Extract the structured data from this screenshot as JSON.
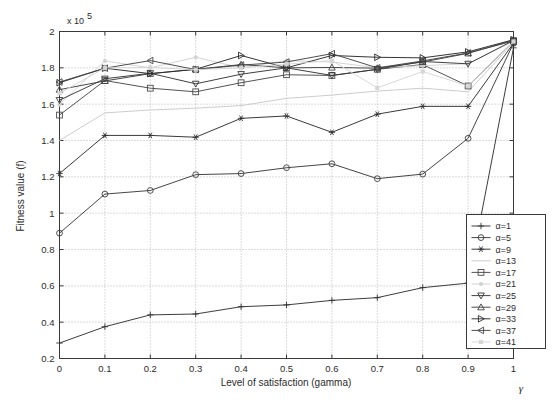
{
  "chart_data": {
    "type": "line",
    "title": "",
    "xlabel": "Level of satisfaction (gamma)",
    "ylabel": "Fitness value (f)",
    "y_multiplier_label": "x 10",
    "y_multiplier_exponent": "5",
    "x_axis_symbol": "γ",
    "xlim": [
      0,
      1
    ],
    "ylim": [
      0.2,
      2
    ],
    "grid": true,
    "legend_position": "lower right",
    "x": [
      0,
      0.1,
      0.2,
      0.3,
      0.4,
      0.5,
      0.6,
      0.7,
      0.8,
      0.9,
      1
    ],
    "xticklabels": [
      "0",
      "0.1",
      "0.2",
      "0.3",
      "0.4",
      "0.5",
      "0.6",
      "0.7",
      "0.8",
      "0.9",
      "1"
    ],
    "yticklabels": [
      "0.2",
      "0.4",
      "0.6",
      "0.8",
      "1",
      "1.2",
      "1.4",
      "1.6",
      "1.8",
      "2"
    ],
    "yticks": [
      0.2,
      0.4,
      0.6,
      0.8,
      1.0,
      1.2,
      1.4,
      1.6,
      1.8,
      2.0
    ],
    "series": [
      {
        "name": "α=1",
        "marker": "plus",
        "color": "#333333",
        "values": [
          0.285,
          0.375,
          0.44,
          0.445,
          0.485,
          0.495,
          0.52,
          0.535,
          0.59,
          0.615,
          1.91
        ]
      },
      {
        "name": "α=5",
        "marker": "circle",
        "color": "#3b3b3b",
        "values": [
          0.89,
          1.105,
          1.125,
          1.212,
          1.218,
          1.25,
          1.272,
          1.19,
          1.215,
          1.412,
          1.935
        ]
      },
      {
        "name": "α=9",
        "marker": "asterisk",
        "color": "#2e2e2e",
        "values": [
          1.218,
          1.428,
          1.428,
          1.418,
          1.522,
          1.535,
          1.445,
          1.545,
          1.588,
          1.588,
          1.935
        ]
      },
      {
        "name": "α=13",
        "marker": "none",
        "color": "#c9c9c9",
        "values": [
          1.4,
          1.552,
          1.568,
          1.578,
          1.592,
          1.632,
          1.65,
          1.672,
          1.688,
          1.668,
          1.94
        ]
      },
      {
        "name": "α=17",
        "marker": "square",
        "color": "#4a4a4a",
        "values": [
          1.54,
          1.73,
          1.688,
          1.668,
          1.718,
          1.762,
          1.758,
          1.792,
          1.818,
          1.7,
          1.945
        ]
      },
      {
        "name": "α=21",
        "marker": "dot",
        "color": "#d2d2d2",
        "values": [
          1.598,
          1.838,
          1.8,
          1.858,
          1.8,
          1.84,
          1.832,
          1.8,
          1.812,
          1.822,
          1.95
        ]
      },
      {
        "name": "α=25",
        "marker": "triangle-down",
        "color": "#363636",
        "values": [
          1.622,
          1.74,
          1.77,
          1.712,
          1.765,
          1.8,
          1.758,
          1.792,
          1.835,
          1.822,
          1.95
        ]
      },
      {
        "name": "α=29",
        "marker": "triangle-up",
        "color": "#3f3f3f",
        "values": [
          1.68,
          1.728,
          1.768,
          1.792,
          1.818,
          1.8,
          1.802,
          1.798,
          1.832,
          1.88,
          1.952
        ]
      },
      {
        "name": "α=33",
        "marker": "triangle-right",
        "color": "#2a2a2a",
        "values": [
          1.718,
          1.798,
          1.768,
          1.792,
          1.868,
          1.8,
          1.868,
          1.858,
          1.855,
          1.888,
          1.955
        ]
      },
      {
        "name": "α=37",
        "marker": "triangle-left",
        "color": "#444444",
        "values": [
          1.722,
          1.798,
          1.84,
          1.79,
          1.815,
          1.832,
          1.878,
          1.8,
          1.838,
          1.882,
          1.948
        ]
      },
      {
        "name": "α=41",
        "marker": "dot-small",
        "color": "#d6d6d6",
        "values": [
          1.66,
          1.8,
          1.802,
          1.79,
          1.8,
          1.82,
          1.84,
          1.69,
          1.78,
          1.7,
          1.945
        ]
      }
    ]
  },
  "legend": {
    "items": [
      "α=1",
      "α=5",
      "α=9",
      "α=13",
      "α=17",
      "α=21",
      "α=25",
      "α=29",
      "α=33",
      "α=37",
      "α=41"
    ]
  }
}
